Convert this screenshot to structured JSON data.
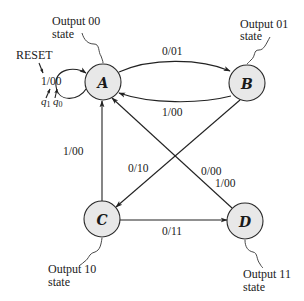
{
  "diagram": {
    "type": "state-machine",
    "title": "",
    "states": [
      {
        "id": "A",
        "label": "A",
        "output": "00",
        "note_line1": "Output 00",
        "note_line2": "state"
      },
      {
        "id": "B",
        "label": "B",
        "output": "01",
        "note_line1": "Output 01",
        "note_line2": "state"
      },
      {
        "id": "C",
        "label": "C",
        "output": "10",
        "note_line1": "Output 10",
        "note_line2": "state"
      },
      {
        "id": "D",
        "label": "D",
        "output": "11",
        "note_line1": "Output 11",
        "note_line2": "state"
      }
    ],
    "transitions": [
      {
        "from": "A",
        "to": "A",
        "label": "1/00"
      },
      {
        "from": "A",
        "to": "B",
        "label": "0/01"
      },
      {
        "from": "B",
        "to": "A",
        "label": "1/00"
      },
      {
        "from": "B",
        "to": "C",
        "label": "0/10"
      },
      {
        "from": "C",
        "to": "A",
        "label": "1/00"
      },
      {
        "from": "C",
        "to": "D",
        "label": "0/11"
      },
      {
        "from": "D",
        "to": "A",
        "label_line1": "0/00",
        "label_line2": "1/00"
      }
    ],
    "annotations": {
      "reset": "RESET",
      "q1": "q",
      "q1_sub": "1",
      "q0": "q",
      "q0_sub": "0"
    }
  },
  "colors": {
    "state_fill": "#e8e8e8",
    "stroke": "#222222",
    "background": "#ffffff"
  }
}
